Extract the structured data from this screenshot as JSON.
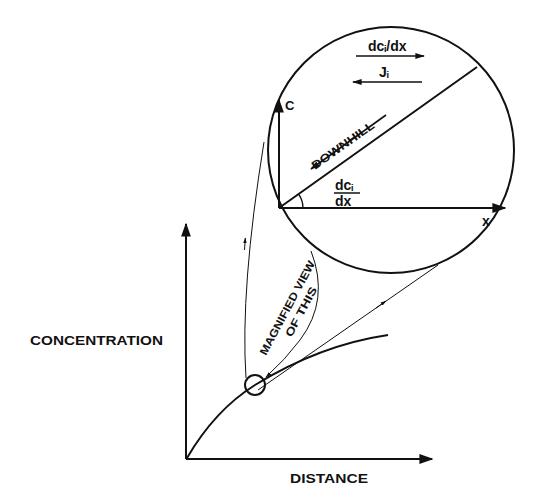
{
  "diagram": {
    "main_axes": {
      "y_label": "CONCENTRATION",
      "x_label": "DISTANCE"
    },
    "callout": {
      "line1": "MAGNIFIED VIEW",
      "line2": "OF THIS"
    },
    "inset": {
      "y_axis_label": "C",
      "x_axis_label": "x",
      "slope_label_num": "dcᵢ",
      "slope_label_den": "dx",
      "downhill_label": "DOWNHILL",
      "gradient_arrow_label": "dcᵢ/dx",
      "flux_arrow_label": "Jᵢ"
    },
    "colors": {
      "ink": "#111111",
      "background": "#ffffff"
    }
  }
}
